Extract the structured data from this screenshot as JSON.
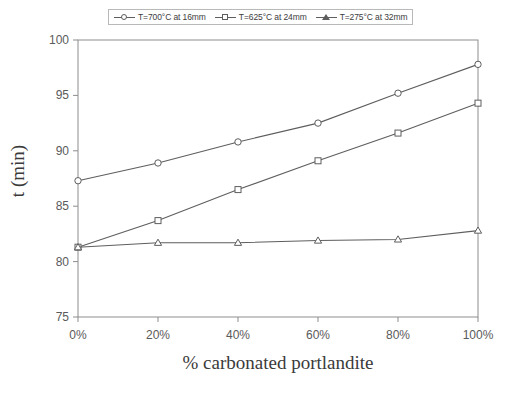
{
  "chart_data": {
    "type": "line",
    "title": "",
    "xlabel": "% carbonated portlandite",
    "ylabel": "t (min)",
    "x": [
      0,
      20,
      40,
      60,
      80,
      100
    ],
    "categories": [
      "0%",
      "20%",
      "40%",
      "60%",
      "80%",
      "100%"
    ],
    "xlim": [
      0,
      100
    ],
    "ylim": [
      75,
      100
    ],
    "yticks": [
      75,
      80,
      85,
      90,
      95,
      100
    ],
    "ytick_labels": [
      "75",
      "80",
      "85",
      "90",
      "95",
      "100"
    ],
    "xtick_labels": [
      "0%",
      "20%",
      "40%",
      "60%",
      "80%",
      "100%"
    ],
    "grid": false,
    "legend_position": "top-center",
    "series": [
      {
        "name": "T=700°C at 16mm",
        "marker": "circle",
        "color": "#5e5e5e",
        "values": [
          87.3,
          88.9,
          90.8,
          92.5,
          95.2,
          97.8
        ]
      },
      {
        "name": "T=625°C at 24mm",
        "marker": "square",
        "color": "#5e5e5e",
        "values": [
          81.3,
          83.7,
          86.5,
          89.1,
          91.6,
          94.3
        ]
      },
      {
        "name": "T=275°C at 32mm",
        "marker": "triangle",
        "color": "#5e5e5e",
        "values": [
          81.3,
          81.7,
          81.7,
          81.9,
          82.0,
          82.8
        ]
      }
    ]
  },
  "legend": {
    "entries": [
      {
        "label": "T=700°C at 16mm",
        "marker": "circle"
      },
      {
        "label": "T=625°C at 24mm",
        "marker": "square"
      },
      {
        "label": "T=275°C at 32mm",
        "marker": "triangle"
      }
    ]
  },
  "axes": {
    "x_title": "% carbonated portlandite",
    "y_title": "t (min)"
  }
}
